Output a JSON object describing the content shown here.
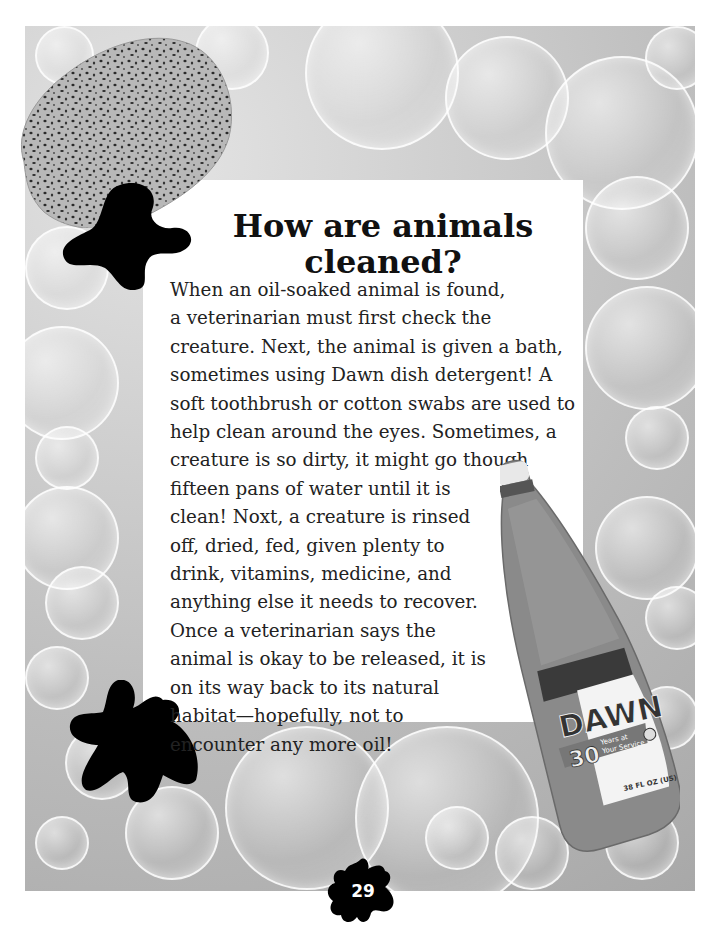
{
  "page": {
    "title_line1": "How are animals",
    "title_line2": "cleaned?",
    "body_lines": [
      "When an oil-soaked animal is found,",
      "a veterinarian must first check the",
      "creature.  Next, the animal is given a bath,",
      "sometimes using Dawn dish detergent! A",
      "soft toothbrush or cotton swabs are used to",
      "help clean around the eyes.  Sometimes, a",
      "creature is so dirty, it might go though",
      "fifteen pans of water until it is",
      "clean!  Noxt, a creature is rinsed",
      "off, dried, fed, given plenty to",
      "drink, vitamins, medicine, and",
      "anything else it needs to recover.",
      "Once a veterinarian says the",
      "animal is okay to be released, it is",
      "on its way back to its natural",
      "habitat—hopefully, not to",
      "encounter any more oil!"
    ],
    "page_number": "29"
  },
  "images": {
    "sponge": "sponge-image",
    "bottle": {
      "brand": "DAWN",
      "badge_number": "30",
      "badge_text_1": "Years at",
      "badge_text_2": "Your Service",
      "volume": "38 FL OZ (US)"
    },
    "background": "soap-bubbles"
  },
  "colors": {
    "text": "#222222",
    "frame_gray": "#bdbdbd",
    "blob": "#000000",
    "page_bg": "#ffffff"
  }
}
